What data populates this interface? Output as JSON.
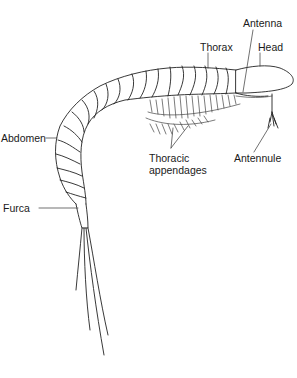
{
  "diagram": {
    "labels": [
      {
        "id": "antenna",
        "text": "Antenna"
      },
      {
        "id": "thorax",
        "text": "Thorax"
      },
      {
        "id": "head",
        "text": "Head"
      },
      {
        "id": "abdomen",
        "text": "Abdomen"
      },
      {
        "id": "thoracic-appendages",
        "text": "Thoracic\nappendages"
      },
      {
        "id": "antennule",
        "text": "Antennule"
      },
      {
        "id": "furca",
        "text": "Furca"
      }
    ],
    "colors": {
      "line": "#222222",
      "background": "#ffffff",
      "hatch": "#555555"
    }
  }
}
